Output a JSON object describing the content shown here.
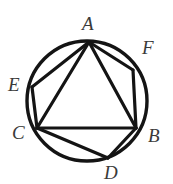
{
  "figure": {
    "name": "circle-with-inscribed-hexagon-and-triangle",
    "background_color": "#ffffff",
    "stroke_color": "#141414",
    "label_color": "#3a3a3a",
    "circle": {
      "cx": 87,
      "cy": 101,
      "r": 60,
      "stroke_width": 3.4
    },
    "points": [
      {
        "id": "A",
        "label": "A",
        "x": 89,
        "y": 42,
        "label_x": 82,
        "label_y": 14
      },
      {
        "id": "B",
        "label": "B",
        "x": 136,
        "y": 128,
        "label_x": 148,
        "label_y": 126
      },
      {
        "id": "C",
        "label": "C",
        "x": 37,
        "y": 128,
        "label_x": 12,
        "label_y": 123
      },
      {
        "id": "D",
        "label": "D",
        "x": 108,
        "y": 158,
        "label_x": 104,
        "label_y": 163
      },
      {
        "id": "E",
        "label": "E",
        "x": 32,
        "y": 87,
        "label_x": 8,
        "label_y": 75
      },
      {
        "id": "F",
        "label": "F",
        "x": 133,
        "y": 70,
        "label_x": 142,
        "label_y": 38
      }
    ],
    "segments": [
      {
        "name": "segment-A-F",
        "from": "A",
        "to": "F",
        "width": 3.2
      },
      {
        "name": "segment-F-B",
        "from": "F",
        "to": "B",
        "width": 3.2
      },
      {
        "name": "segment-B-D",
        "from": "B",
        "to": "D",
        "width": 3.2
      },
      {
        "name": "segment-D-C",
        "from": "D",
        "to": "C",
        "width": 3.2
      },
      {
        "name": "segment-C-E",
        "from": "C",
        "to": "E",
        "width": 3.2
      },
      {
        "name": "segment-E-A",
        "from": "E",
        "to": "A",
        "width": 3.2
      },
      {
        "name": "segment-A-B",
        "from": "A",
        "to": "B",
        "width": 3.2
      },
      {
        "name": "segment-B-C",
        "from": "B",
        "to": "C",
        "width": 3.2
      },
      {
        "name": "segment-C-A",
        "from": "C",
        "to": "A",
        "width": 3.2
      }
    ]
  }
}
